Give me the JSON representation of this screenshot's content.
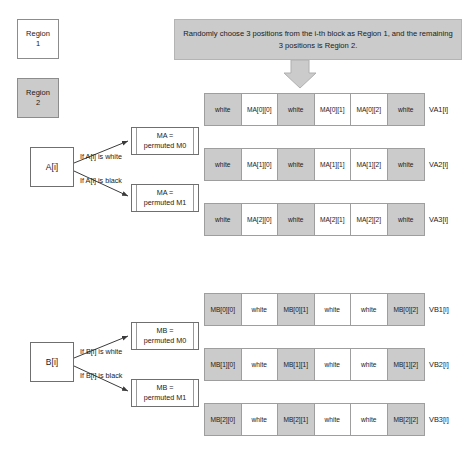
{
  "legend": {
    "region1": {
      "line1": "Region",
      "line2": "1"
    },
    "region2": {
      "line1": "Region",
      "line2": "2"
    }
  },
  "caption": {
    "text": "Randomly choose 3 positions from the i-th block as Region 1, and the remaining 3 positions is Region 2."
  },
  "branches": {
    "a": {
      "source": "A[i]",
      "cond_white": "If A[i] is white",
      "cond_black": "If A[i] is black",
      "target_white_line1": "MA =",
      "target_white_line2": "permuted M0",
      "target_black_line1": "MA =",
      "target_black_line2": "permuted M1"
    },
    "b": {
      "source": "B[i]",
      "cond_white": "If B[i] is white",
      "cond_black": "If B[i] is black",
      "target_white_line1": "MB =",
      "target_white_line2": "permuted M0",
      "target_black_line1": "MB =",
      "target_black_line2": "permuted M1"
    }
  },
  "colors": {
    "region2_fill": "#cbcbcb",
    "region1_fill": "#ffffff",
    "caption_fill": "#cbcbcb",
    "border": "#9e9e9e"
  },
  "blocks": [
    {
      "label": "VA1[i]",
      "cells": [
        {
          "text": "white",
          "shade": "gray"
        },
        {
          "text": "MA[0][0]",
          "shade": "light"
        },
        {
          "text": "white",
          "shade": "gray"
        },
        {
          "text": "MA[0][1]",
          "shade": "light"
        },
        {
          "text": "MA[0][2]",
          "shade": "light"
        },
        {
          "text": "white",
          "shade": "gray"
        }
      ]
    },
    {
      "label": "VA2[i]",
      "cells": [
        {
          "text": "white",
          "shade": "gray"
        },
        {
          "text": "MA[1][0]",
          "shade": "light"
        },
        {
          "text": "white",
          "shade": "gray"
        },
        {
          "text": "MA[1][1]",
          "shade": "light"
        },
        {
          "text": "MA[1][2]",
          "shade": "light"
        },
        {
          "text": "white",
          "shade": "gray"
        }
      ]
    },
    {
      "label": "VA3[i]",
      "cells": [
        {
          "text": "white",
          "shade": "gray"
        },
        {
          "text": "MA[2][0]",
          "shade": "light"
        },
        {
          "text": "white",
          "shade": "gray"
        },
        {
          "text": "MA[2][1]",
          "shade": "light"
        },
        {
          "text": "MA[2][2]",
          "shade": "light"
        },
        {
          "text": "white",
          "shade": "gray"
        }
      ]
    },
    {
      "label": "VB1[i]",
      "cells": [
        {
          "text": "MB[0][0]",
          "shade": "gray"
        },
        {
          "text": "white",
          "shade": "light"
        },
        {
          "text": "MB[0][1]",
          "shade": "gray"
        },
        {
          "text": "white",
          "shade": "light"
        },
        {
          "text": "white",
          "shade": "light"
        },
        {
          "text": "MB[0][2]",
          "shade": "gray"
        }
      ]
    },
    {
      "label": "VB2[i]",
      "cells": [
        {
          "text": "MB[1][0]",
          "shade": "gray"
        },
        {
          "text": "white",
          "shade": "light"
        },
        {
          "text": "MB[1][1]",
          "shade": "gray"
        },
        {
          "text": "white",
          "shade": "light"
        },
        {
          "text": "white",
          "shade": "light"
        },
        {
          "text": "MB[1][2]",
          "shade": "gray"
        }
      ]
    },
    {
      "label": "VB3[i]",
      "cells": [
        {
          "text": "MB[2][0]",
          "shade": "gray"
        },
        {
          "text": "white",
          "shade": "light"
        },
        {
          "text": "MB[2][1]",
          "shade": "gray"
        },
        {
          "text": "white",
          "shade": "light"
        },
        {
          "text": "white",
          "shade": "light"
        },
        {
          "text": "MB[2][2]",
          "shade": "gray"
        }
      ]
    }
  ]
}
